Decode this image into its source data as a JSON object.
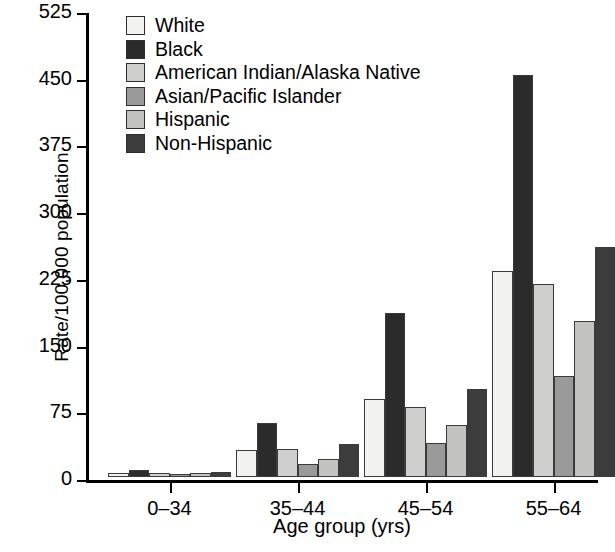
{
  "chart_data": {
    "type": "bar",
    "title": "",
    "xlabel": "Age group (yrs)",
    "ylabel": "Rate/100,000 population",
    "categories": [
      "0–34",
      "35–44",
      "45–54",
      "55–64"
    ],
    "ylim": [
      0,
      525
    ],
    "yticks": [
      0,
      75,
      150,
      225,
      300,
      375,
      450,
      525
    ],
    "ytick_labels": [
      "0",
      "75",
      "150",
      "225",
      "300",
      "375",
      "450",
      "525"
    ],
    "grid": false,
    "legend_position": "top-left-inside",
    "series": [
      {
        "name": "White",
        "color": "#f2f2f0",
        "values": [
          4,
          30,
          88,
          232
        ]
      },
      {
        "name": "Black",
        "color": "#2b2b2b",
        "values": [
          8,
          61,
          184,
          452
        ]
      },
      {
        "name": "American Indian/Alaska Native",
        "color": "#cfcfcd",
        "values": [
          4,
          31,
          79,
          217
        ]
      },
      {
        "name": "Asian/Pacific Islander",
        "color": "#9a9a9a",
        "values": [
          3,
          15,
          38,
          113
        ]
      },
      {
        "name": "Hispanic",
        "color": "#c2c2bf",
        "values": [
          4,
          20,
          58,
          175
        ]
      },
      {
        "name": "Non-Hispanic",
        "color": "#3c3c3c",
        "values": [
          6,
          37,
          99,
          259
        ]
      }
    ]
  },
  "legend": {
    "items": [
      {
        "label": "White"
      },
      {
        "label": "Black"
      },
      {
        "label": "American Indian/Alaska Native"
      },
      {
        "label": "Asian/Pacific Islander"
      },
      {
        "label": "Hispanic"
      },
      {
        "label": "Non-Hispanic"
      }
    ]
  }
}
